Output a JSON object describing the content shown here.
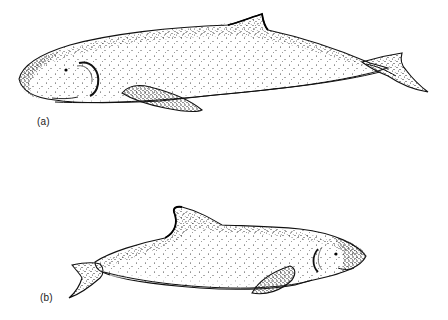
{
  "figure": {
    "panels": [
      {
        "id": "a",
        "label": "(a)",
        "subject": "whale-illustration-large-blunt-head",
        "facing": "left",
        "style": "stipple drawing"
      },
      {
        "id": "b",
        "label": "(b)",
        "subject": "porpoise-illustration-tall-dorsal-fin",
        "facing": "right",
        "style": "stipple drawing"
      }
    ],
    "caption_partial": ""
  },
  "colors": {
    "ink": "#111111",
    "background": "#ffffff"
  }
}
